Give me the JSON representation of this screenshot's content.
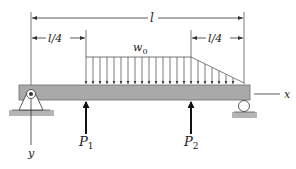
{
  "diagram": {
    "type": "simply-supported beam with distributed and point loads",
    "labels": {
      "total_length": "l",
      "left_quarter": "l/4",
      "right_quarter": "l/4",
      "load_intensity": "w",
      "load_intensity_sub": "0",
      "point_load_1": "P",
      "point_load_1_sub": "1",
      "point_load_2": "P",
      "point_load_2_sub": "2",
      "x_axis": "x",
      "y_axis": "y"
    },
    "colors": {
      "beam": "#a9a9a9",
      "beam_edge": "#6e6e6e",
      "lines": "#333333",
      "ground": "#b5b5b5"
    }
  }
}
